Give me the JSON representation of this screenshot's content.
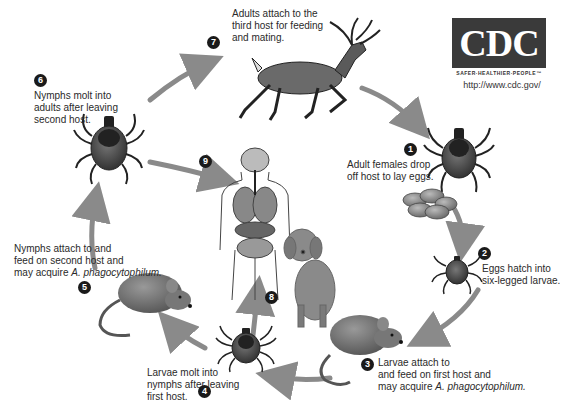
{
  "logo": {
    "text": "CDC",
    "tagline": "SAFER·HEALTHIER·PEOPLE™",
    "url": "http://www.cdc.gov/"
  },
  "steps": [
    {
      "number": "1",
      "lines": [
        "Adult females drop",
        "off host to lay eggs."
      ]
    },
    {
      "number": "2",
      "lines": [
        "Eggs hatch into",
        "six-legged larvae."
      ]
    },
    {
      "number": "3",
      "lines": [
        "Larvae attach to",
        "and feed on first host and",
        "may acquire "
      ],
      "italic": "A. phagocytophilum."
    },
    {
      "number": "4",
      "lines": [
        "Larvae molt into",
        "nymphs after leaving",
        "first host."
      ]
    },
    {
      "number": "5",
      "lines": [
        "Nymphs attach to and",
        "feed on second host and",
        "may acquire "
      ],
      "italic": "A. phagocytophilum."
    },
    {
      "number": "6",
      "lines": [
        "Nymphs molt into",
        "adults after leaving",
        "second host."
      ]
    },
    {
      "number": "7",
      "lines": [
        "Adults attach to the",
        "third host for feeding",
        "and mating."
      ]
    },
    {
      "number": "8",
      "lines": []
    },
    {
      "number": "9",
      "lines": []
    }
  ],
  "illustrations": [
    "deer",
    "adult-tick",
    "egg-cluster",
    "larva-tick",
    "mouse-first-host",
    "nymph-tick",
    "mouse-second-host",
    "adult-tick-left",
    "human-anatomy",
    "dog"
  ],
  "colors": {
    "arrow": "#8a8a8a",
    "badge": "#1a1a1a",
    "tick_body": "#555555",
    "mouse": "#777777",
    "dog": "#8a8a8a",
    "cdc_box": "#3a3a3a"
  }
}
